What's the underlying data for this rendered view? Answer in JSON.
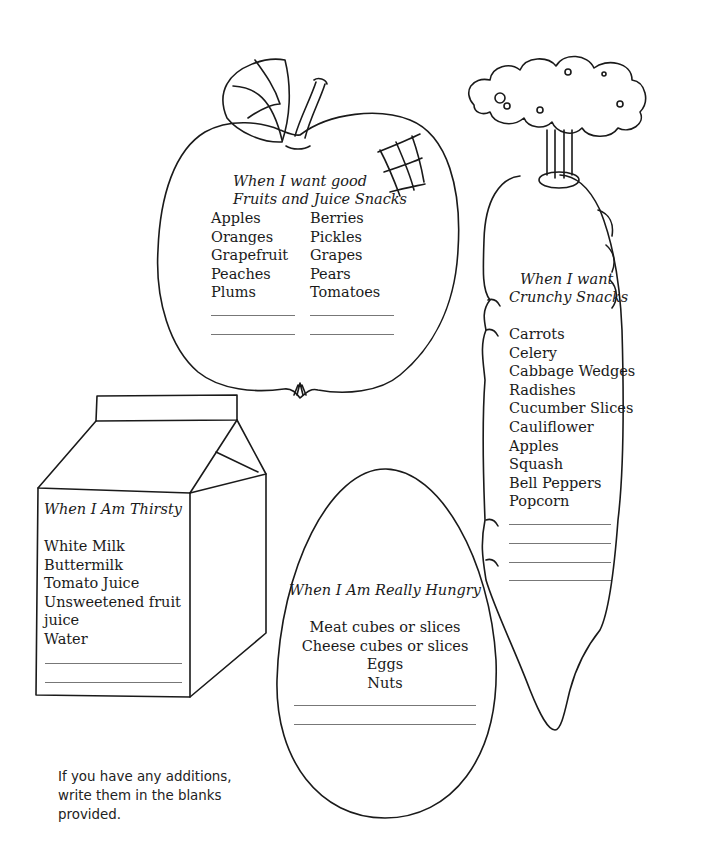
{
  "apple": {
    "heading_line1": "When I want good",
    "heading_line2": "Fruits and Juice Snacks",
    "left_items": [
      "Apples",
      "Oranges",
      "Grapefruit",
      "Peaches",
      "Plums"
    ],
    "right_items": [
      "Berries",
      "Pickles",
      "Grapes",
      "Pears",
      "Tomatoes"
    ],
    "blank_lines_per_column": 2
  },
  "carrot": {
    "heading_line1": "When I want",
    "heading_line2": "Crunchy Snacks",
    "items": [
      "Carrots",
      "Celery",
      "Cabbage Wedges",
      "Radishes",
      "Cucumber Slices",
      "Cauliflower",
      "Apples",
      "Squash",
      "Bell Peppers",
      "Popcorn"
    ],
    "blank_lines": 4
  },
  "milk_carton": {
    "heading": "When I Am Thirsty",
    "items": [
      "White Milk",
      "Buttermilk",
      "Tomato Juice",
      "Unsweetened fruit",
      "juice",
      "Water"
    ],
    "blank_lines": 2
  },
  "egg": {
    "heading": "When I Am Really Hungry",
    "items": [
      "Meat cubes or slices",
      "Cheese cubes or slices",
      "Eggs",
      "Nuts"
    ],
    "blank_lines": 2
  },
  "footer_note": {
    "line1": "If you have any additions,",
    "line2": "write them in the blanks",
    "line3": "provided."
  },
  "colors": {
    "ink": "#1a1a1a",
    "blank_line": "#777777",
    "paper": "#ffffff"
  }
}
